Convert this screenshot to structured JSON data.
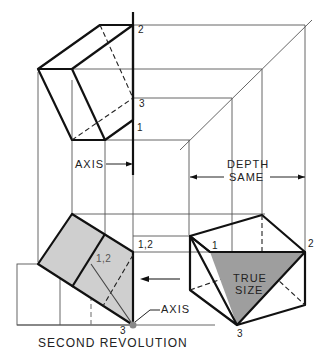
{
  "labels": {
    "top_pt2": "2",
    "top_pt3": "3",
    "top_pt1": "1",
    "axis_top": "AXIS",
    "depth": "DEPTH",
    "same": "SAME",
    "front_pt12_outer": "1,2",
    "front_pt12_inner": "1,2",
    "front_pt3": "3",
    "axis_bottom": "AXIS",
    "side_pt1": "1",
    "side_pt2": "2",
    "side_pt3": "3",
    "true": "TRUE",
    "size": "SIZE",
    "caption": "SECOND REVOLUTION"
  },
  "colors": {
    "line": "#111111",
    "construction": "#555555",
    "shade": "#c8c8c8",
    "true_size_shade": "#9a9a9a"
  }
}
